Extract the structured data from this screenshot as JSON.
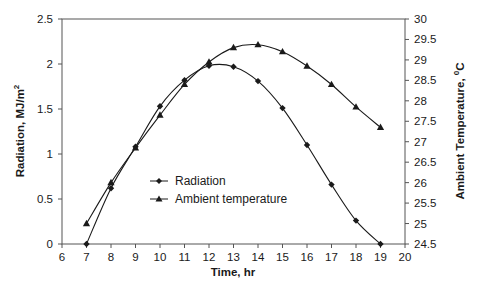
{
  "chart_data": {
    "type": "line",
    "title": "",
    "xlabel": "Time, hr",
    "ylabel": "Radiation, MJ/m²",
    "y2label": "Ambient Temperature, °C",
    "xlim": [
      6,
      20
    ],
    "ylim": [
      0,
      2.5
    ],
    "y2lim": [
      24.5,
      30
    ],
    "x_ticks": [
      "6",
      "7",
      "8",
      "9",
      "10",
      "11",
      "12",
      "13",
      "14",
      "15",
      "16",
      "17",
      "18",
      "19",
      "20"
    ],
    "y_ticks": [
      "0",
      "0.5",
      "1",
      "1.5",
      "2",
      "2.5"
    ],
    "y2_ticks": [
      "24.5",
      "25",
      "25.5",
      "26",
      "26.5",
      "27",
      "27.5",
      "28",
      "28.5",
      "29",
      "29.5",
      "30"
    ],
    "grid": false,
    "legend_position": "inside-lower-center",
    "x": [
      7,
      8,
      9,
      10,
      11,
      12,
      13,
      14,
      15,
      16,
      17,
      18,
      19
    ],
    "series": [
      {
        "name": "Radiation",
        "axis": "left",
        "marker": "diamond",
        "values": [
          0,
          0.62,
          1.08,
          1.53,
          1.82,
          1.98,
          1.97,
          1.81,
          1.51,
          1.1,
          0.66,
          0.26,
          0
        ]
      },
      {
        "name": "Ambient temperature",
        "axis": "right",
        "marker": "triangle",
        "values": [
          25.0,
          26.0,
          26.85,
          27.65,
          28.4,
          28.95,
          29.3,
          29.37,
          29.2,
          28.85,
          28.4,
          27.85,
          27.35
        ]
      }
    ]
  },
  "labels": {
    "xlabel": "Time, hr",
    "ylabel_main": "Radiation, MJ/m",
    "ylabel_sup": "2",
    "y2label_main": "Ambient Temperature, ",
    "y2label_sup": "0",
    "y2label_tail": "C",
    "legend_radiation": "Radiation",
    "legend_temperature": "Ambient temperature"
  },
  "colors": {
    "line": "#1a1a1a",
    "axis": "#555555",
    "background": "#ffffff"
  }
}
